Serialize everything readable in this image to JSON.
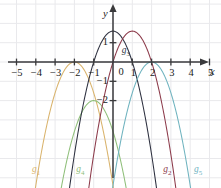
{
  "chart_data": {
    "type": "line",
    "title": "",
    "xlabel": "x",
    "ylabel": "y",
    "xlim": [
      -5.8,
      5.6
    ],
    "ylim": [
      -6.5,
      2.3
    ],
    "grid": true,
    "grid_color": "#e9e9ec",
    "axis_color": "#3a3a3c",
    "xticks": [
      -5,
      -4,
      -3,
      -2,
      -1,
      1,
      2,
      3,
      4,
      5
    ],
    "xtick_labels": [
      "−5",
      "−4",
      "−3",
      "−2",
      "−1",
      "1",
      "2",
      "3",
      "4",
      "5"
    ],
    "yticks": [
      1,
      -1,
      -2
    ],
    "ytick_labels": [
      "1",
      "−1",
      "−2"
    ],
    "origin_label": "0",
    "legend_position": "inline-curve-labels",
    "series": [
      {
        "name": "g1",
        "label": "g",
        "sublabel": "1",
        "color": "#d9b36c",
        "vertex": [
          -2,
          0
        ],
        "a": -1.6,
        "label_pos": [
          -4.2,
          -5.6
        ]
      },
      {
        "name": "g4",
        "label": "g",
        "sublabel": "4",
        "color": "#8fbf7a",
        "vertex": [
          -1,
          -2
        ],
        "a": -1.6,
        "label_pos": [
          -1.9,
          -5.6
        ]
      },
      {
        "name": "g3",
        "label": "g",
        "sublabel": "3",
        "color": "#2e3140",
        "vertex": [
          0,
          1.6
        ],
        "a": -1.6,
        "label_pos": [
          0.45,
          0.55
        ]
      },
      {
        "name": "g2",
        "label": "g",
        "sublabel": "2",
        "color": "#8c3a4a",
        "vertex": [
          1,
          1.6
        ],
        "a": -1.6,
        "label_pos": [
          2.6,
          -5.6
        ]
      },
      {
        "name": "g5",
        "label": "g",
        "sublabel": "5",
        "color": "#6fb3bf",
        "vertex": [
          2,
          0
        ],
        "a": -1.6,
        "label_pos": [
          4.2,
          -5.6
        ]
      }
    ]
  }
}
